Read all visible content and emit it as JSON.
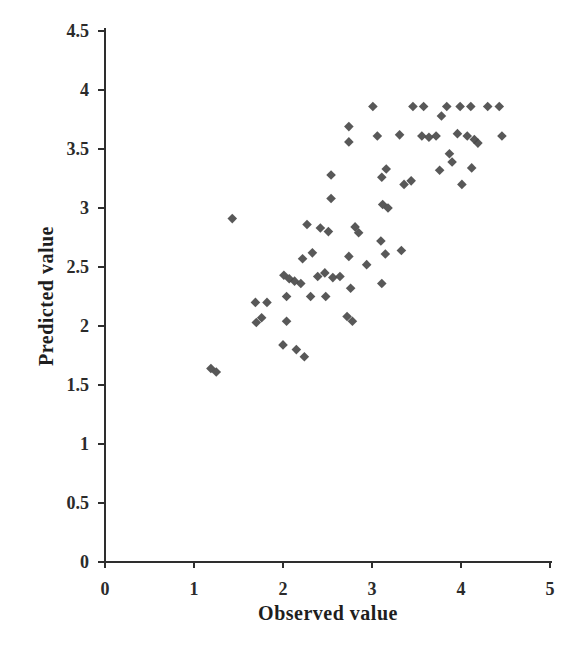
{
  "figure": {
    "background_color": "#ffffff",
    "axis_color": "#2e2e2e",
    "marker_color": "#4b4b4b",
    "marker_shape": "diamond",
    "marker_size_px": 9.6
  },
  "chart_data": {
    "type": "scatter",
    "title": "",
    "xlabel": "Observed value",
    "ylabel": "Predicted value",
    "xlim": [
      0,
      5
    ],
    "ylim": [
      0,
      4.5
    ],
    "x_ticks": [
      0,
      1,
      2,
      3,
      4,
      5
    ],
    "y_ticks": [
      0,
      0.5,
      1,
      1.5,
      2,
      2.5,
      3,
      3.5,
      4,
      4.5
    ],
    "grid": false,
    "legend_position": "none",
    "series": [
      {
        "name": "predicted-vs-observed",
        "points": [
          [
            3.01,
            3.86
          ],
          [
            3.46,
            3.86
          ],
          [
            3.58,
            3.86
          ],
          [
            3.84,
            3.86
          ],
          [
            3.99,
            3.86
          ],
          [
            4.11,
            3.86
          ],
          [
            4.3,
            3.86
          ],
          [
            4.43,
            3.86
          ],
          [
            3.78,
            3.78
          ],
          [
            2.74,
            3.69
          ],
          [
            2.74,
            3.56
          ],
          [
            3.06,
            3.61
          ],
          [
            3.31,
            3.62
          ],
          [
            3.56,
            3.61
          ],
          [
            3.64,
            3.6
          ],
          [
            3.72,
            3.61
          ],
          [
            3.96,
            3.63
          ],
          [
            4.07,
            3.61
          ],
          [
            4.15,
            3.58
          ],
          [
            4.19,
            3.55
          ],
          [
            4.46,
            3.61
          ],
          [
            3.87,
            3.46
          ],
          [
            3.9,
            3.39
          ],
          [
            3.76,
            3.32
          ],
          [
            4.12,
            3.34
          ],
          [
            4.01,
            3.2
          ],
          [
            2.54,
            3.28
          ],
          [
            3.16,
            3.33
          ],
          [
            3.11,
            3.26
          ],
          [
            3.36,
            3.2
          ],
          [
            3.44,
            3.23
          ],
          [
            2.54,
            3.08
          ],
          [
            3.12,
            3.03
          ],
          [
            3.18,
            3.0
          ],
          [
            1.43,
            2.91
          ],
          [
            2.27,
            2.86
          ],
          [
            2.42,
            2.83
          ],
          [
            2.51,
            2.8
          ],
          [
            2.81,
            2.84
          ],
          [
            2.85,
            2.79
          ],
          [
            3.1,
            2.72
          ],
          [
            2.22,
            2.57
          ],
          [
            2.33,
            2.62
          ],
          [
            2.74,
            2.59
          ],
          [
            3.15,
            2.61
          ],
          [
            3.33,
            2.64
          ],
          [
            2.94,
            2.52
          ],
          [
            2.01,
            2.43
          ],
          [
            2.07,
            2.4
          ],
          [
            2.13,
            2.38
          ],
          [
            2.2,
            2.36
          ],
          [
            2.39,
            2.42
          ],
          [
            2.47,
            2.45
          ],
          [
            2.56,
            2.41
          ],
          [
            2.64,
            2.42
          ],
          [
            2.76,
            2.32
          ],
          [
            3.11,
            2.36
          ],
          [
            1.69,
            2.2
          ],
          [
            1.82,
            2.2
          ],
          [
            2.04,
            2.25
          ],
          [
            2.31,
            2.25
          ],
          [
            2.48,
            2.25
          ],
          [
            1.7,
            2.03
          ],
          [
            1.76,
            2.07
          ],
          [
            2.04,
            2.04
          ],
          [
            2.72,
            2.08
          ],
          [
            2.78,
            2.04
          ],
          [
            2.0,
            1.84
          ],
          [
            2.15,
            1.8
          ],
          [
            2.24,
            1.74
          ],
          [
            1.19,
            1.64
          ],
          [
            1.25,
            1.61
          ]
        ]
      }
    ]
  }
}
